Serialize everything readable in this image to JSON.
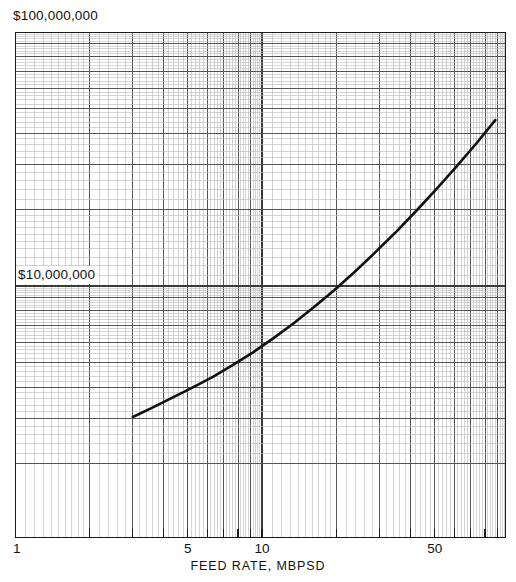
{
  "figure": {
    "title": "",
    "background_color": "#ffffff",
    "ink_color": "#111111"
  },
  "labels": {
    "top_value": "$100,000,000",
    "mid_value": "$10,000,000",
    "x_axis_title": "FEED  RATE, MBPSD"
  },
  "chart_data": {
    "type": "line",
    "title": "",
    "subtitle": "",
    "xlabel": "FEED  RATE, MBPSD",
    "ylabel": "",
    "xscale": "log",
    "yscale": "log",
    "grid": "log-log graph paper, full minor grid",
    "legend": "none",
    "xlim": [
      1,
      90
    ],
    "ylim": [
      1000000,
      100000000
    ],
    "x_ticks": [
      1,
      5,
      10,
      50
    ],
    "x_tick_labels": [
      "1",
      "5",
      "10",
      "50"
    ],
    "y_ticks": [
      10000000,
      100000000
    ],
    "y_tick_labels": [
      "$10,000,000",
      "$100,000,000"
    ],
    "series": [
      {
        "name": "Plant investment vs feed rate",
        "x": [
          3.0,
          3.6,
          4.3,
          5.2,
          6.3,
          7.6,
          9.2,
          11.1,
          13.4,
          16.2,
          19.6,
          23.7,
          28.6,
          34.6,
          41.8,
          50.5,
          61.0,
          73.7,
          88.0
        ],
        "y": [
          3050000,
          3320000,
          3620000,
          3970000,
          4380000,
          4880000,
          5480000,
          6220000,
          7120000,
          8240000,
          9620000,
          11350000,
          13500000,
          16200000,
          19600000,
          23900000,
          29400000,
          36400000,
          45000000
        ]
      }
    ],
    "annotations": []
  },
  "grid_spec": {
    "x_decade_px": 247,
    "y_decade_px": 254,
    "x_origin_value": 1,
    "y_top_value": 100000000,
    "minor_line_color": "#b8b8b8",
    "decade_line_color": "#3a3a3a",
    "half_decade_line_color": "#8a8a8a",
    "curve_color": "#111111",
    "curve_width_px": 2.6
  }
}
